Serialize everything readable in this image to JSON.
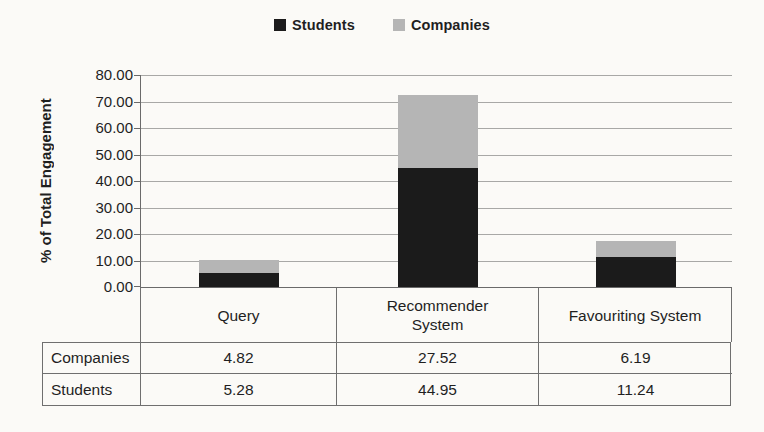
{
  "chart_data": {
    "type": "bar",
    "stacked": true,
    "title": "",
    "categories": [
      "Query",
      "Recommender System",
      "Favouriting System"
    ],
    "categories_display": [
      "Query",
      "Recommender\nSystem",
      "Favouriting System"
    ],
    "series": [
      {
        "name": "Students",
        "color": "#1b1b1b",
        "values": [
          5.28,
          44.95,
          11.24
        ]
      },
      {
        "name": "Companies",
        "color": "#b5b5b5",
        "values": [
          4.82,
          27.52,
          6.19
        ]
      }
    ],
    "xlabel": "",
    "ylabel": "% of Total Engagement",
    "ylim": [
      0,
      80
    ],
    "ytick_step": 10,
    "ytick_labels": [
      "80.00",
      "70.00",
      "60.00",
      "50.00",
      "40.00",
      "30.00",
      "20.00",
      "10.00",
      "0.00"
    ],
    "grid": true,
    "legend_position": "top-center",
    "data_table": {
      "rows": [
        {
          "label": "Companies",
          "values": [
            "4.82",
            "27.52",
            "6.19"
          ]
        },
        {
          "label": "Students",
          "values": [
            "5.28",
            "44.95",
            "11.24"
          ]
        }
      ]
    }
  }
}
